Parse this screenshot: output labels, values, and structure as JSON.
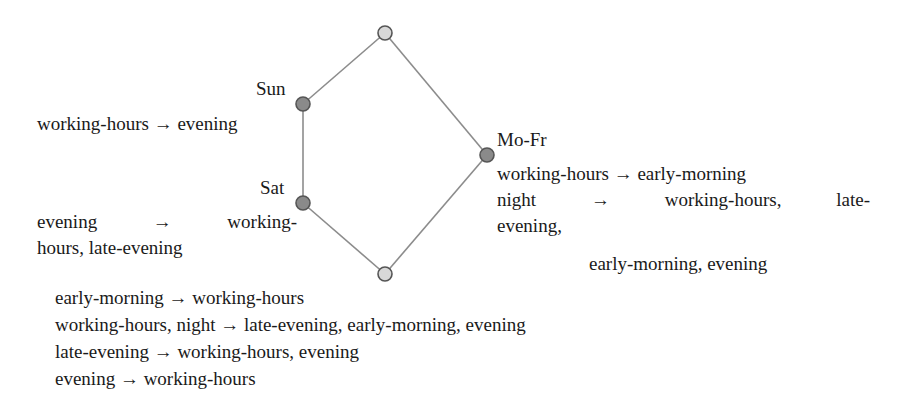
{
  "diagram": {
    "type": "lattice",
    "nodes": [
      {
        "id": "top",
        "label": "",
        "x": 385,
        "y": 33,
        "fill": "#d8d8d8"
      },
      {
        "id": "sun",
        "label": "Sun",
        "x": 303,
        "y": 104,
        "fill": "#8a8a8a"
      },
      {
        "id": "sat",
        "label": "Sat",
        "x": 303,
        "y": 203,
        "fill": "#8a8a8a"
      },
      {
        "id": "mofr",
        "label": "Mo-Fr",
        "x": 487,
        "y": 155,
        "fill": "#8a8a8a"
      },
      {
        "id": "bottom",
        "label": "",
        "x": 385,
        "y": 274,
        "fill": "#d8d8d8"
      }
    ],
    "edges": [
      [
        "top",
        "sun"
      ],
      [
        "sun",
        "sat"
      ],
      [
        "sat",
        "bottom"
      ],
      [
        "top",
        "mofr"
      ],
      [
        "mofr",
        "bottom"
      ]
    ],
    "labels": {
      "sun": "Sun",
      "sat": "Sat",
      "mofr": "Mo-Fr"
    },
    "rules": {
      "sun": [
        "working-hours → evening"
      ],
      "sat": {
        "line1_parts": [
          "evening",
          "→",
          "working-"
        ],
        "line2": "hours, late-evening"
      },
      "mofr": {
        "line1": "working-hours → early-morning",
        "line2_parts": [
          "night",
          "→",
          "working-hours,",
          "late-"
        ],
        "line3": "evening,",
        "line4": "early-morning, evening"
      },
      "bottom": [
        "early-morning → working-hours",
        "working-hours, night → late-evening, early-morning, evening",
        "late-evening → working-hours, evening",
        "evening → working-hours"
      ]
    }
  }
}
